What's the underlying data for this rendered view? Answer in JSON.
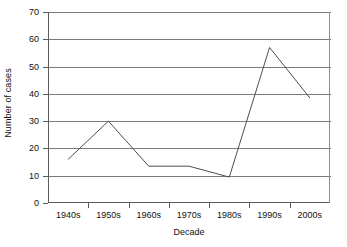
{
  "chart_data": {
    "type": "line",
    "title": "",
    "xlabel": "Decade",
    "ylabel": "Number of cases",
    "categories": [
      "1940s",
      "1950s",
      "1960s",
      "1970s",
      "1980s",
      "1990s",
      "2000s"
    ],
    "values": [
      16,
      30,
      13.5,
      13.5,
      9.5,
      57,
      38.5
    ],
    "series": [
      {
        "name": "Number of cases",
        "values": [
          16,
          30,
          13.5,
          13.5,
          9.5,
          57,
          38.5
        ]
      }
    ],
    "ylim": [
      0,
      70
    ],
    "yticks": [
      0,
      10,
      20,
      30,
      40,
      50,
      60,
      70
    ],
    "ytick_labels": [
      "0",
      "10",
      "20",
      "30",
      "40",
      "50",
      "60",
      "70"
    ],
    "grid": "horizontal",
    "legend": "none",
    "line_color": "#4d4d4d",
    "gridline_color": "#7a7a7a",
    "axis_color": "#5b5b5b",
    "background_color": "#ffffff",
    "markers": "none"
  }
}
